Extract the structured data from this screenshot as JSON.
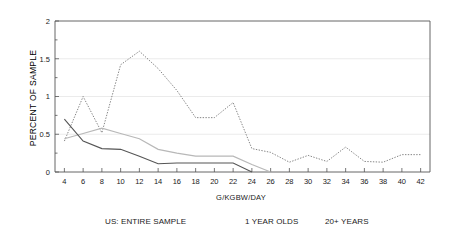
{
  "chart_data": {
    "type": "line",
    "title": "",
    "xlabel": "G/KGBW/DAY",
    "ylabel": "PERCENT OF SAMPLE",
    "xlim": [
      3,
      43
    ],
    "ylim": [
      0,
      2
    ],
    "yticks": [
      0,
      0.5,
      1,
      1.5,
      2
    ],
    "ytick_labels": [
      "0",
      "0.5",
      "1",
      "1.5",
      "2"
    ],
    "y_minor_step": 0.25,
    "gridlines": [
      0.5,
      1,
      1.5
    ],
    "grid": true,
    "legend_position": "below",
    "xticks": [
      4,
      6,
      8,
      10,
      12,
      14,
      16,
      18,
      20,
      22,
      24,
      26,
      28,
      30,
      32,
      34,
      36,
      38,
      40,
      42
    ],
    "xtick_labels": [
      "4",
      "6",
      "8",
      "10",
      "12",
      "14",
      "16",
      "18",
      "20",
      "22",
      "24",
      "26",
      "28",
      "30",
      "32",
      "34",
      "36",
      "38",
      "40",
      "42"
    ],
    "series": [
      {
        "name": "US: ENTIRE SAMPLE",
        "style": "dotted",
        "color": "#777777",
        "x": [
          4,
          6,
          8,
          10,
          12,
          14,
          16,
          18,
          20,
          22,
          24,
          26,
          28,
          30,
          32,
          34,
          36,
          38,
          40,
          42
        ],
        "values": [
          0.41,
          1.0,
          0.52,
          1.42,
          1.6,
          1.37,
          1.08,
          0.72,
          0.72,
          0.92,
          0.31,
          0.26,
          0.13,
          0.22,
          0.14,
          0.33,
          0.14,
          0.13,
          0.23,
          0.23
        ]
      },
      {
        "name": "1 YEAR OLDS",
        "style": "solid-light",
        "color": "#b8b8b8",
        "x": [
          4,
          6,
          8,
          10,
          12,
          14,
          16,
          18,
          20,
          22,
          24,
          26
        ],
        "values": [
          0.44,
          0.51,
          0.58,
          0.51,
          0.44,
          0.3,
          0.25,
          0.21,
          0.21,
          0.21,
          0.1,
          0.0
        ]
      },
      {
        "name": "20+ YEARS",
        "style": "solid-dark",
        "color": "#555555",
        "x": [
          4,
          6,
          8,
          10,
          12,
          14,
          16,
          18,
          20,
          22,
          24
        ],
        "values": [
          0.7,
          0.41,
          0.31,
          0.3,
          0.21,
          0.11,
          0.12,
          0.12,
          0.12,
          0.12,
          0.0
        ]
      }
    ]
  },
  "legend": {
    "items": [
      {
        "label": "US: ENTIRE SAMPLE"
      },
      {
        "label": "1 YEAR OLDS"
      },
      {
        "label": "20+ YEARS"
      }
    ]
  }
}
